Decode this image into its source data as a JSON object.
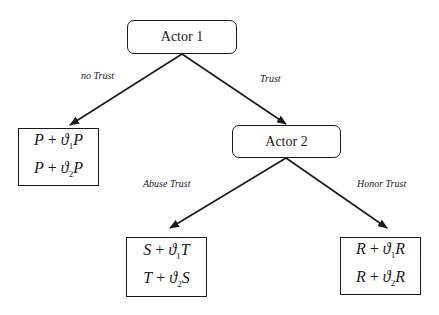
{
  "nodes": {
    "actor1": {
      "label": "Actor 1"
    },
    "actor2": {
      "label": "Actor 2"
    }
  },
  "edges": {
    "no_trust": "no Trust",
    "trust": "Trust",
    "abuse_trust": "Abuse Trust",
    "honor_trust": "Honor Trust"
  },
  "payoffs": {
    "no_trust": {
      "line1": {
        "a": "P",
        "op": " + ",
        "theta": "ϑ",
        "sub": "1",
        "b": "P"
      },
      "line2": {
        "a": "P",
        "op": " + ",
        "theta": "ϑ",
        "sub": "2",
        "b": "P"
      }
    },
    "abuse_trust": {
      "line1": {
        "a": "S",
        "op": " + ",
        "theta": "ϑ",
        "sub": "1",
        "b": "T"
      },
      "line2": {
        "a": "T",
        "op": " + ",
        "theta": "ϑ",
        "sub": "2",
        "b": "S"
      }
    },
    "honor_trust": {
      "line1": {
        "a": "R",
        "op": " + ",
        "theta": "ϑ",
        "sub": "1",
        "b": "R"
      },
      "line2": {
        "a": "R",
        "op": " + ",
        "theta": "ϑ",
        "sub": "2",
        "b": "R"
      }
    }
  }
}
